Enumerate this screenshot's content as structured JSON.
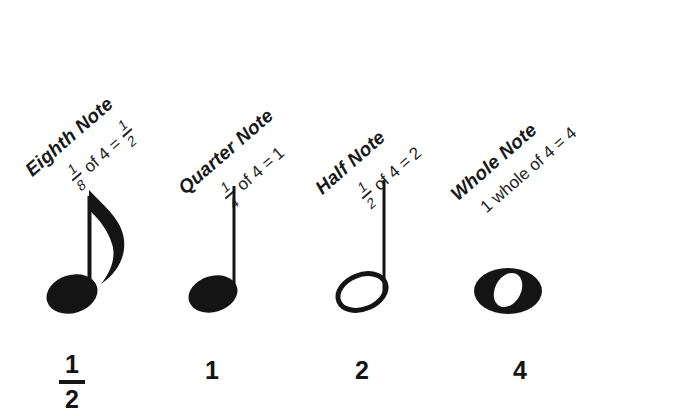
{
  "page": {
    "background_color": "#ffffff",
    "ink_color": "#1a1a1a"
  },
  "notes": [
    {
      "id": "eighth-note",
      "title": "Eighth Note",
      "formula": {
        "fraction": {
          "numerator": "1",
          "denominator": "8"
        },
        "middle": "of 4 =",
        "result_fraction": {
          "numerator": "1",
          "denominator": "2"
        },
        "full_text": "1/8 of 4 = 1/2"
      },
      "glyph": "eighth-note-glyph",
      "beats": {
        "numerator": "1",
        "denominator": "2",
        "full_text": "1/2"
      }
    },
    {
      "id": "quarter-note",
      "title": "Quarter Note",
      "formula": {
        "fraction": {
          "numerator": "1",
          "denominator": "4"
        },
        "middle": "of 4 =",
        "result": "1",
        "full_text": "1/4 of 4 = 1"
      },
      "glyph": "quarter-note-glyph",
      "beats": {
        "value": "1",
        "full_text": "1"
      }
    },
    {
      "id": "half-note",
      "title": "Half Note",
      "formula": {
        "fraction": {
          "numerator": "1",
          "denominator": "2"
        },
        "middle": "of 4 =",
        "result": "2",
        "full_text": "1/2 of 4 = 2"
      },
      "glyph": "half-note-glyph",
      "beats": {
        "value": "2",
        "full_text": "2"
      }
    },
    {
      "id": "whole-note",
      "title": "Whole Note",
      "formula": {
        "lead": "1 whole of 4 = 4",
        "full_text": "1 whole of 4 = 4"
      },
      "glyph": "whole-note-glyph",
      "beats": {
        "value": "4",
        "full_text": "4"
      }
    }
  ]
}
